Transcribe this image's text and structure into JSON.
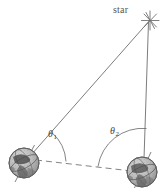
{
  "figure": {
    "background_color": "#ffffff",
    "line_color": "#6e6e6e",
    "ink_color": "#3c3c3c",
    "globe_color": "#9a9a9a",
    "labels": {
      "star": "star",
      "theta1": "θ",
      "theta1_sub": "1",
      "theta2": "θ",
      "theta2_sub": "2"
    },
    "nodes": {
      "star": {
        "x": 150,
        "y": 20,
        "name": "star"
      },
      "earth_left": {
        "x": 24,
        "y": 163,
        "name": "earth-position-1"
      },
      "earth_right": {
        "x": 142,
        "y": 172,
        "name": "earth-position-2"
      }
    },
    "edges": [
      {
        "name": "sightline-left-to-star",
        "from": "earth_left",
        "to": "star",
        "style": "solid"
      },
      {
        "name": "sightline-right-to-star",
        "from": "earth_right",
        "to": "star",
        "style": "solid"
      },
      {
        "name": "baseline",
        "from": "earth_left",
        "to": "earth_right",
        "style": "dashed"
      }
    ],
    "angles": [
      {
        "name": "theta-1",
        "vertex": "earth_left",
        "label": "θ₁"
      },
      {
        "name": "theta-2",
        "vertex": "earth_right",
        "label": "θ₂"
      }
    ],
    "globe_radius": 15
  }
}
